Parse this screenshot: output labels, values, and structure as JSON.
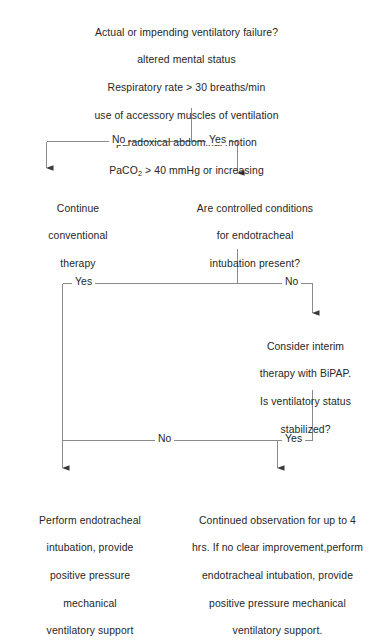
{
  "diagram": {
    "line_color": "#8a8a8a",
    "text_color": "#262626",
    "background": "#ffffff"
  },
  "nodes": {
    "root": {
      "lines": [
        "Actual or impending ventilatory failure?",
        "altered mental status",
        "Respiratory rate > 30 breaths/min",
        "use of accessory muscles of ventilation",
        "paradoxical abdominal motion"
      ],
      "paco2_prefix": "PaCO",
      "paco2_subscript": "2",
      "paco2_suffix": " > 40 mmHg or increasing"
    },
    "continue_conventional": {
      "lines": [
        "Continue",
        "conventional",
        "therapy"
      ]
    },
    "controlled_conditions": {
      "lines": [
        "Are controlled conditions",
        "for endotracheal",
        "intubation present?"
      ]
    },
    "bipap": {
      "lines": [
        "Consider interim",
        "therapy with BiPAP.",
        "Is ventilatory status",
        "stabilized?"
      ]
    },
    "perform_intubation": {
      "lines": [
        "Perform endotracheal",
        "intubation, provide",
        "positive pressure",
        "mechanical",
        "ventilatory support"
      ]
    },
    "continued_observation": {
      "lines": [
        "Continued observation for up to 4",
        "hrs.  If no clear improvement,perform",
        "endotracheal intubation, provide",
        "positive pressure mechanical",
        "ventilatory support."
      ]
    }
  },
  "edge_labels": {
    "branch1_no": "No",
    "branch1_yes": "Yes",
    "branch2_yes": "Yes",
    "branch2_no": "No",
    "branch3_no": "No",
    "branch3_yes": "Yes"
  }
}
